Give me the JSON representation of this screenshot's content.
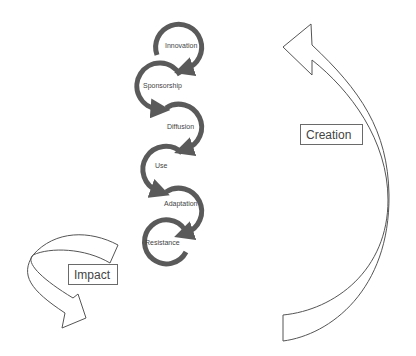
{
  "diagram": {
    "stages": [
      {
        "label": "Innovation"
      },
      {
        "label": "Sponsorship"
      },
      {
        "label": "Diffusion"
      },
      {
        "label": "Use"
      },
      {
        "label": "Adaptation"
      },
      {
        "label": "Resistance"
      }
    ],
    "creation_label": "Creation",
    "impact_label": "Impact",
    "colors": {
      "cycle_arrow": "#5a5a5a",
      "outline": "#555555",
      "text": "#444444"
    }
  }
}
